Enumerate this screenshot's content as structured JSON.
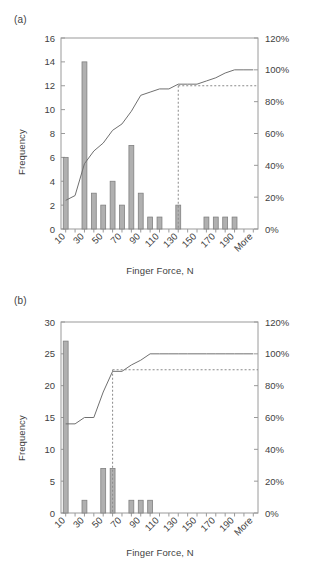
{
  "figure": {
    "panels": [
      {
        "tag": "(a)",
        "ylabel": "Frequency",
        "xlabel": "Finger Force, N"
      },
      {
        "tag": "(b)",
        "ylabel": "Frequency",
        "xlabel": "Finger Force, N"
      }
    ]
  },
  "chart_data": [
    {
      "type": "bar",
      "title": "(a)",
      "xlabel": "Finger Force, N",
      "ylabel": "Frequency",
      "y2label": "",
      "categories": [
        "10",
        "20",
        "30",
        "40",
        "50",
        "60",
        "70",
        "80",
        "90",
        "100",
        "110",
        "120",
        "130",
        "140",
        "150",
        "160",
        "170",
        "180",
        "190",
        "200",
        "More"
      ],
      "tick_labels": [
        "10",
        "",
        "30",
        "",
        "50",
        "",
        "70",
        "",
        "90",
        "",
        "110",
        "",
        "130",
        "",
        "150",
        "",
        "170",
        "",
        "190",
        "",
        "More"
      ],
      "values": [
        6,
        0,
        14,
        3,
        2,
        4,
        2,
        7,
        3,
        1,
        1,
        0,
        2,
        0,
        0,
        1,
        1,
        1,
        1,
        0,
        0
      ],
      "cumulative_percent": [
        18,
        18,
        41,
        49,
        54,
        64,
        69,
        87,
        95,
        97,
        100,
        100,
        90,
        90,
        90,
        93,
        95,
        98,
        100,
        100,
        100
      ],
      "cumulative_display": [
        18,
        21,
        41,
        49,
        54,
        62,
        66,
        74,
        84,
        86,
        88,
        88,
        91,
        91,
        91,
        93,
        95,
        98,
        100,
        100,
        100
      ],
      "ylim": [
        0,
        16
      ],
      "yticks": [
        0,
        2,
        4,
        6,
        8,
        10,
        12,
        14,
        16
      ],
      "y2lim": [
        0,
        120
      ],
      "y2ticks": [
        "0%",
        "20%",
        "40%",
        "60%",
        "80%",
        "100%",
        "120%"
      ],
      "cutoff_percent": 90,
      "cutoff_category": "130",
      "grid": false,
      "legend": "none"
    },
    {
      "type": "bar",
      "title": "(b)",
      "xlabel": "Finger Force, N",
      "ylabel": "Frequency",
      "y2label": "",
      "categories": [
        "10",
        "20",
        "30",
        "40",
        "50",
        "60",
        "70",
        "80",
        "90",
        "100",
        "110",
        "120",
        "130",
        "140",
        "150",
        "160",
        "170",
        "180",
        "190",
        "200",
        "More"
      ],
      "tick_labels": [
        "10",
        "",
        "30",
        "",
        "50",
        "",
        "70",
        "",
        "90",
        "",
        "110",
        "",
        "130",
        "",
        "150",
        "",
        "170",
        "",
        "190",
        "",
        "More"
      ],
      "values": [
        27,
        0,
        2,
        0,
        7,
        7,
        0,
        2,
        2,
        2,
        0,
        0,
        0,
        0,
        0,
        0,
        0,
        0,
        0,
        0,
        0
      ],
      "cumulative_display": [
        56,
        56,
        60,
        60,
        76,
        89,
        89,
        93,
        96,
        100,
        100,
        100,
        100,
        100,
        100,
        100,
        100,
        100,
        100,
        100,
        100
      ],
      "ylim": [
        0,
        30
      ],
      "yticks": [
        0,
        5,
        10,
        15,
        20,
        25,
        30
      ],
      "y2lim": [
        0,
        120
      ],
      "y2ticks": [
        "0%",
        "20%",
        "40%",
        "60%",
        "80%",
        "100%",
        "120%"
      ],
      "cutoff_percent": 90,
      "cutoff_category": "60",
      "grid": false,
      "legend": "none"
    }
  ],
  "colors": {
    "bar_fill": "#b0b0b0",
    "bar_stroke": "#808080",
    "line": "#707070",
    "axis": "#9a9a9a",
    "text": "#3f3f3f",
    "dashed": "#8a8a8a"
  }
}
